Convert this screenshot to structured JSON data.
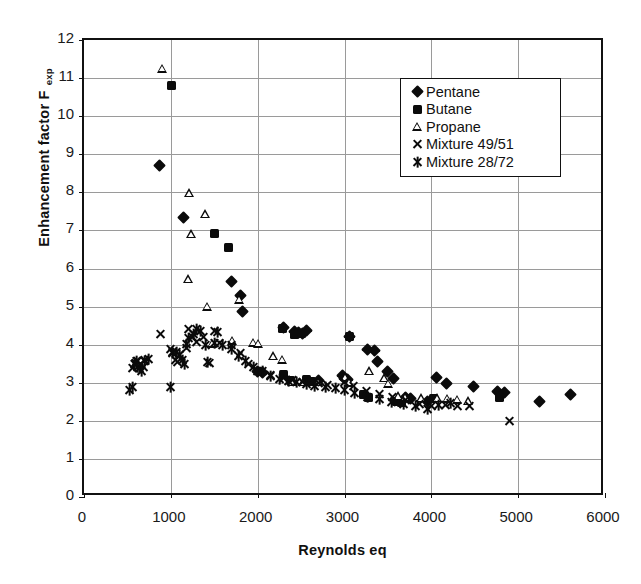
{
  "chart_data": {
    "type": "scatter",
    "title": "",
    "xlabel": "Reynolds eq",
    "ylabel": "Enhancement factor F",
    "ylabel_subscript": "exp",
    "xlim": [
      0,
      6000
    ],
    "ylim": [
      0,
      12
    ],
    "xticks": [
      0,
      1000,
      2000,
      3000,
      4000,
      5000,
      6000
    ],
    "yticks": [
      0,
      1,
      2,
      3,
      4,
      5,
      6,
      7,
      8,
      9,
      10,
      11,
      12
    ],
    "grid": true,
    "legend_position": "upper-right",
    "marker_color": "#0b0b0b",
    "series": [
      {
        "name": "Pentane",
        "marker": "filled-diamond",
        "points": [
          [
            870,
            8.7
          ],
          [
            1150,
            7.33
          ],
          [
            1700,
            5.65
          ],
          [
            1800,
            5.3
          ],
          [
            1830,
            4.88
          ],
          [
            2000,
            3.3
          ],
          [
            2060,
            3.28
          ],
          [
            2300,
            4.45
          ],
          [
            2420,
            4.35
          ],
          [
            2470,
            4.32
          ],
          [
            2520,
            4.3
          ],
          [
            2560,
            4.38
          ],
          [
            2700,
            3.05
          ],
          [
            2980,
            3.18
          ],
          [
            3000,
            3.12
          ],
          [
            3040,
            3.08
          ],
          [
            3060,
            4.22
          ],
          [
            3260,
            3.88
          ],
          [
            3340,
            3.85
          ],
          [
            3380,
            3.55
          ],
          [
            3500,
            3.3
          ],
          [
            3560,
            3.12
          ],
          [
            3700,
            2.6
          ],
          [
            3760,
            2.58
          ],
          [
            3960,
            2.52
          ],
          [
            4060,
            3.15
          ],
          [
            4180,
            2.98
          ],
          [
            4480,
            2.9
          ],
          [
            4760,
            2.78
          ],
          [
            4840,
            2.75
          ],
          [
            5250,
            2.52
          ],
          [
            5600,
            2.68
          ]
        ]
      },
      {
        "name": "Butane",
        "marker": "filled-square",
        "points": [
          [
            1010,
            10.8
          ],
          [
            1500,
            6.92
          ],
          [
            1660,
            6.55
          ],
          [
            2290,
            4.42
          ],
          [
            2420,
            4.28
          ],
          [
            2500,
            4.3
          ],
          [
            2300,
            3.22
          ],
          [
            2380,
            3.05
          ],
          [
            2560,
            3.08
          ],
          [
            2620,
            3.02
          ],
          [
            3060,
            4.22
          ],
          [
            3220,
            2.68
          ],
          [
            3280,
            2.62
          ],
          [
            3600,
            2.52
          ],
          [
            3660,
            2.48
          ],
          [
            4020,
            2.58
          ],
          [
            4780,
            2.62
          ]
        ]
      },
      {
        "name": "Propane",
        "marker": "open-triangle",
        "points": [
          [
            900,
            11.25
          ],
          [
            1210,
            7.98
          ],
          [
            1230,
            6.9
          ],
          [
            1390,
            7.42
          ],
          [
            1200,
            5.72
          ],
          [
            1420,
            5.0
          ],
          [
            1790,
            5.18
          ],
          [
            1700,
            4.1
          ],
          [
            1470,
            4.02
          ],
          [
            1950,
            4.05
          ],
          [
            2000,
            4.02
          ],
          [
            2180,
            3.7
          ],
          [
            2280,
            3.6
          ],
          [
            2400,
            3.02
          ],
          [
            2520,
            3.02
          ],
          [
            2700,
            3.02
          ],
          [
            3000,
            3.15
          ],
          [
            3050,
            3.0
          ],
          [
            3280,
            3.3
          ],
          [
            3460,
            3.12
          ],
          [
            3500,
            2.98
          ],
          [
            3620,
            2.65
          ],
          [
            3700,
            2.62
          ],
          [
            3880,
            2.6
          ],
          [
            4060,
            2.6
          ],
          [
            4180,
            2.58
          ],
          [
            4300,
            2.55
          ],
          [
            4420,
            2.52
          ]
        ]
      },
      {
        "name": "Mixture 49/51",
        "marker": "x-cross",
        "points": [
          [
            560,
            3.4
          ],
          [
            590,
            3.52
          ],
          [
            620,
            3.58
          ],
          [
            650,
            3.48
          ],
          [
            680,
            3.42
          ],
          [
            700,
            3.6
          ],
          [
            880,
            4.28
          ],
          [
            1000,
            3.88
          ],
          [
            1020,
            3.82
          ],
          [
            1050,
            3.6
          ],
          [
            1080,
            3.55
          ],
          [
            1100,
            3.72
          ],
          [
            1180,
            3.9
          ],
          [
            1200,
            4.42
          ],
          [
            1250,
            4.2
          ],
          [
            1300,
            4.08
          ],
          [
            1380,
            4.2
          ],
          [
            1450,
            3.52
          ],
          [
            1500,
            4.35
          ],
          [
            1560,
            4.05
          ],
          [
            1700,
            3.98
          ],
          [
            1800,
            3.78
          ],
          [
            1900,
            3.5
          ],
          [
            2000,
            3.3
          ],
          [
            2150,
            3.2
          ],
          [
            2300,
            3.12
          ],
          [
            2400,
            3.08
          ],
          [
            2520,
            3.02
          ],
          [
            2700,
            3.0
          ],
          [
            2800,
            2.95
          ],
          [
            3000,
            3.02
          ],
          [
            3100,
            2.92
          ],
          [
            3250,
            2.78
          ],
          [
            3400,
            2.7
          ],
          [
            3550,
            2.62
          ],
          [
            3700,
            2.55
          ],
          [
            3860,
            2.45
          ],
          [
            4000,
            2.38
          ],
          [
            4160,
            2.42
          ],
          [
            4300,
            2.4
          ],
          [
            4440,
            2.38
          ],
          [
            4900,
            2.0
          ]
        ]
      },
      {
        "name": "Mixture 28/72",
        "marker": "six-star",
        "points": [
          [
            520,
            2.82
          ],
          [
            560,
            2.88
          ],
          [
            580,
            3.5
          ],
          [
            600,
            3.58
          ],
          [
            620,
            3.42
          ],
          [
            640,
            3.38
          ],
          [
            660,
            3.3
          ],
          [
            700,
            3.58
          ],
          [
            740,
            3.62
          ],
          [
            1000,
            2.88
          ],
          [
            1020,
            3.78
          ],
          [
            1060,
            3.82
          ],
          [
            1100,
            3.72
          ],
          [
            1140,
            3.6
          ],
          [
            1160,
            3.5
          ],
          [
            1180,
            4.02
          ],
          [
            1200,
            4.18
          ],
          [
            1260,
            4.28
          ],
          [
            1300,
            4.4
          ],
          [
            1340,
            4.35
          ],
          [
            1400,
            3.98
          ],
          [
            1420,
            3.55
          ],
          [
            1500,
            4.05
          ],
          [
            1540,
            4.32
          ],
          [
            1600,
            3.98
          ],
          [
            1700,
            3.88
          ],
          [
            1780,
            3.7
          ],
          [
            1860,
            3.58
          ],
          [
            1950,
            3.42
          ],
          [
            2050,
            3.3
          ],
          [
            2150,
            3.18
          ],
          [
            2250,
            3.1
          ],
          [
            2350,
            3.05
          ],
          [
            2450,
            3.02
          ],
          [
            2560,
            2.98
          ],
          [
            2660,
            2.92
          ],
          [
            2780,
            2.88
          ],
          [
            2900,
            2.85
          ],
          [
            3000,
            2.8
          ],
          [
            3120,
            2.72
          ],
          [
            3260,
            2.62
          ],
          [
            3400,
            2.58
          ],
          [
            3540,
            2.5
          ],
          [
            3680,
            2.45
          ],
          [
            3820,
            2.4
          ],
          [
            3960,
            2.3
          ],
          [
            4080,
            2.42
          ],
          [
            4220,
            2.48
          ]
        ]
      }
    ]
  },
  "legend": {
    "items": [
      {
        "label": "Pentane",
        "marker": "filled-diamond"
      },
      {
        "label": "Butane",
        "marker": "filled-square"
      },
      {
        "label": "Propane",
        "marker": "open-triangle"
      },
      {
        "label": "Mixture 49/51",
        "marker": "x-cross"
      },
      {
        "label": "Mixture 28/72",
        "marker": "six-star"
      }
    ]
  }
}
